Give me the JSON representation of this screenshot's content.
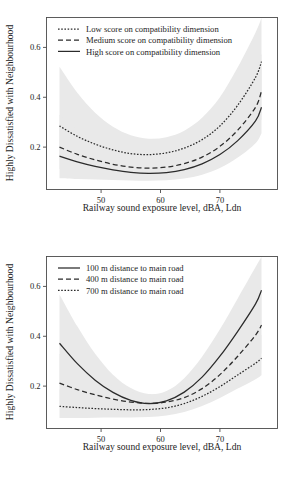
{
  "figure": {
    "panels": [
      {
        "id": "panel-compatibility",
        "chart_data": {
          "type": "line",
          "title": "",
          "xlabel": "Railway sound exposure level, dBA, Ldn",
          "ylabel": "Highly Dissatisfied with Neighbourhood",
          "xlim": [
            43,
            77
          ],
          "ylim": [
            0.03,
            0.72
          ],
          "xticks": [
            50,
            60,
            70
          ],
          "yticks": [
            0.2,
            0.4,
            0.6
          ],
          "xtick_labels": [
            "50",
            "60",
            "70"
          ],
          "ytick_labels": [
            "0.2",
            "0.4",
            "0.6"
          ],
          "grid": false,
          "legend_position": "top-left",
          "band_color": "#e9e9e9",
          "line_color": "#2b2b2b",
          "x": [
            43,
            46,
            49,
            52,
            55,
            58,
            61,
            64,
            67,
            70,
            73,
            76,
            77
          ],
          "series": [
            {
              "name": "Low score on compatibility dimension",
              "style": "dotted",
              "values": [
                0.285,
                0.243,
                0.212,
                0.189,
                0.174,
                0.17,
                0.177,
                0.196,
                0.23,
                0.285,
                0.368,
                0.48,
                0.543
              ],
              "band_low": [
                0.148,
                0.15,
                0.15,
                0.148,
                0.145,
                0.142,
                0.144,
                0.152,
                0.172,
                0.208,
                0.268,
                0.352,
                0.405
              ],
              "band_high": [
                0.522,
                0.418,
                0.338,
                0.282,
                0.248,
                0.234,
                0.24,
                0.266,
                0.318,
                0.4,
                0.52,
                0.66,
                0.72
              ]
            },
            {
              "name": "Medium score on compatibility dimension",
              "style": "dashed",
              "values": [
                0.2,
                0.171,
                0.149,
                0.131,
                0.12,
                0.116,
                0.12,
                0.134,
                0.16,
                0.203,
                0.268,
                0.36,
                0.425
              ],
              "band_low": [
                0.112,
                0.104,
                0.098,
                0.093,
                0.089,
                0.086,
                0.088,
                0.096,
                0.114,
                0.146,
                0.196,
                0.266,
                0.312
              ],
              "band_high": [
                0.33,
                0.272,
                0.224,
                0.186,
                0.162,
                0.154,
                0.162,
                0.186,
                0.228,
                0.292,
                0.386,
                0.508,
                0.575
              ]
            },
            {
              "name": "High score on compatibility dimension",
              "style": "solid",
              "values": [
                0.164,
                0.141,
                0.123,
                0.109,
                0.099,
                0.095,
                0.098,
                0.11,
                0.133,
                0.17,
                0.226,
                0.305,
                0.36
              ],
              "band_low": [
                0.075,
                0.072,
                0.07,
                0.068,
                0.066,
                0.065,
                0.067,
                0.074,
                0.089,
                0.116,
                0.158,
                0.216,
                0.256
              ],
              "band_high": [
                0.288,
                0.238,
                0.198,
                0.168,
                0.149,
                0.142,
                0.148,
                0.168,
                0.204,
                0.26,
                0.34,
                0.448,
                0.512
              ]
            }
          ]
        }
      },
      {
        "id": "panel-distance",
        "chart_data": {
          "type": "line",
          "title": "",
          "xlabel": "Railway sound exposure level, dBA, Ldn",
          "ylabel": "Highly Dissatisfied with Neighbourhood",
          "xlim": [
            43,
            77
          ],
          "ylim": [
            0.03,
            0.72
          ],
          "xticks": [
            50,
            60,
            70
          ],
          "yticks": [
            0.2,
            0.4,
            0.6
          ],
          "xtick_labels": [
            "50",
            "60",
            "70"
          ],
          "ytick_labels": [
            "0.2",
            "0.4",
            "0.6"
          ],
          "grid": false,
          "legend_position": "top-left",
          "band_color": "#e9e9e9",
          "line_color": "#2b2b2b",
          "x": [
            43,
            46,
            49,
            52,
            55,
            58,
            61,
            64,
            67,
            70,
            73,
            76,
            77
          ],
          "series": [
            {
              "name": "100 m distance to main road",
              "style": "solid",
              "values": [
                0.372,
                0.29,
                0.224,
                0.175,
                0.143,
                0.13,
                0.141,
                0.176,
                0.236,
                0.32,
                0.42,
                0.53,
                0.585
              ],
              "band_low": [
                0.215,
                0.18,
                0.15,
                0.126,
                0.11,
                0.104,
                0.11,
                0.132,
                0.172,
                0.232,
                0.308,
                0.396,
                0.44
              ],
              "band_high": [
                0.568,
                0.44,
                0.33,
                0.246,
                0.192,
                0.168,
                0.18,
                0.232,
                0.318,
                0.428,
                0.552,
                0.678,
                0.72
              ]
            },
            {
              "name": "400 m distance to main road",
              "style": "dashed",
              "values": [
                0.212,
                0.186,
                0.165,
                0.148,
                0.136,
                0.131,
                0.136,
                0.154,
                0.19,
                0.246,
                0.32,
                0.405,
                0.445
              ],
              "band_low": [
                0.128,
                0.12,
                0.114,
                0.11,
                0.106,
                0.103,
                0.106,
                0.118,
                0.143,
                0.185,
                0.24,
                0.302,
                0.332
              ],
              "band_high": [
                0.33,
                0.282,
                0.236,
                0.198,
                0.174,
                0.166,
                0.174,
                0.202,
                0.252,
                0.325,
                0.42,
                0.522,
                0.57
              ]
            },
            {
              "name": "700 m distance to main road",
              "style": "dotted",
              "values": [
                0.119,
                0.114,
                0.11,
                0.107,
                0.105,
                0.106,
                0.113,
                0.13,
                0.159,
                0.198,
                0.245,
                0.292,
                0.312
              ],
              "band_low": [
                0.072,
                0.072,
                0.073,
                0.074,
                0.074,
                0.076,
                0.082,
                0.096,
                0.12,
                0.152,
                0.19,
                0.228,
                0.244
              ],
              "band_high": [
                0.186,
                0.172,
                0.16,
                0.15,
                0.145,
                0.146,
                0.156,
                0.178,
                0.214,
                0.263,
                0.322,
                0.382,
                0.406
              ]
            }
          ]
        }
      }
    ]
  }
}
